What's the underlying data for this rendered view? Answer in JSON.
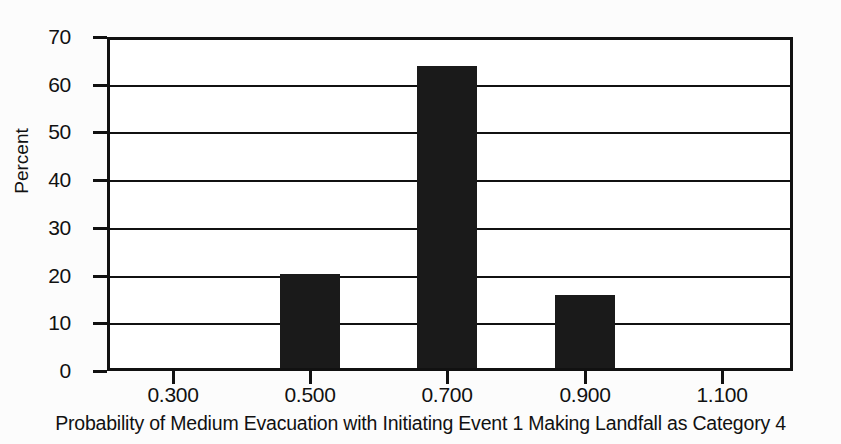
{
  "chart_data": {
    "type": "bar",
    "title": "",
    "xlabel": "Probability of Medium Evacuation with Initiating Event 1 Making Landfall as Category 4",
    "ylabel": "Percent",
    "categories": [
      "0.500",
      "0.700",
      "0.900"
    ],
    "values": [
      20,
      64.5,
      15.5
    ],
    "x_tick_labels": [
      "0.300",
      "0.500",
      "0.700",
      "0.900",
      "1.100"
    ],
    "y_tick_labels": [
      "0",
      "10",
      "20",
      "30",
      "40",
      "50",
      "60",
      "70"
    ],
    "ylim": [
      0,
      70
    ],
    "xlim": [
      0.2,
      1.2
    ],
    "grid": true,
    "legend": "none",
    "bar_color": "#1a1a1a",
    "axis_color": "#111111",
    "background": "#ffffff",
    "series": [
      {
        "name": "Percent",
        "points": [
          {
            "x": "0.500",
            "y": 20
          },
          {
            "x": "0.700",
            "y": 64.5
          },
          {
            "x": "0.900",
            "y": 15.5
          }
        ]
      }
    ]
  }
}
